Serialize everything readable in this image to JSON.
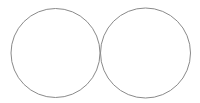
{
  "diagram": {
    "background": "#ffffff",
    "stroke_color": "#8a8a8a",
    "shapes": [
      {
        "type": "circle",
        "name": "left-circle",
        "cx": 55.5,
        "cy": 53,
        "r": 44.5
      },
      {
        "type": "circle",
        "name": "right-circle",
        "cx": 145.5,
        "cy": 53,
        "r": 45
      }
    ]
  }
}
